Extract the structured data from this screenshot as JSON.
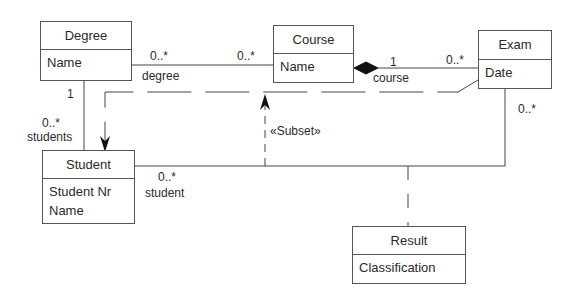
{
  "diagram": {
    "type": "UML class diagram",
    "classes": [
      {
        "id": "degree",
        "name": "Degree",
        "attributes": [
          "Name"
        ]
      },
      {
        "id": "course",
        "name": "Course",
        "attributes": [
          "Name"
        ]
      },
      {
        "id": "exam",
        "name": "Exam",
        "attributes": [
          "Date"
        ]
      },
      {
        "id": "student",
        "name": "Student",
        "attributes": [
          "Student Nr",
          "Name"
        ]
      },
      {
        "id": "result",
        "name": "Result",
        "attributes": [
          "Classification"
        ]
      }
    ],
    "associations": {
      "degree_course": {
        "degree_end_mult": "0..*",
        "degree_end_role": "degree",
        "course_end_mult": "0..*"
      },
      "course_exam": {
        "kind": "composition",
        "course_end_mult": "1",
        "course_end_role": "course",
        "exam_end_mult": "0..*"
      },
      "degree_student": {
        "degree_end_mult": "1",
        "student_end_mult": "0..*",
        "student_end_role": "students"
      },
      "student_exam": {
        "student_end_mult": "0..*",
        "student_end_role": "student",
        "exam_end_mult": "0..*",
        "association_class": "Result"
      }
    },
    "dependency": {
      "stereotype": "«Subset»"
    }
  }
}
